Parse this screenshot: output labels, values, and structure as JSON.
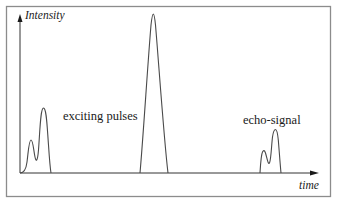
{
  "diagram": {
    "y_axis_label": "Intensity",
    "x_axis_label": "time",
    "annotations": {
      "exciting": "exciting pulses",
      "echo": "echo-signal"
    },
    "colors": {
      "frame": "#8c8c8c",
      "curve": "#4a4a4a",
      "axis": "#333333",
      "text": "#1a1a1a"
    },
    "peaks": [
      {
        "name": "exciting-pulse-small",
        "group": "exciting pulses",
        "relative_height": 0.21
      },
      {
        "name": "exciting-pulse-large",
        "group": "exciting pulses",
        "relative_height": 0.41
      },
      {
        "name": "central-pulse",
        "group": "central",
        "relative_height": 1.0
      },
      {
        "name": "echo-pulse-small",
        "group": "echo-signal",
        "relative_height": 0.14
      },
      {
        "name": "echo-pulse-large",
        "group": "echo-signal",
        "relative_height": 0.27
      }
    ]
  }
}
